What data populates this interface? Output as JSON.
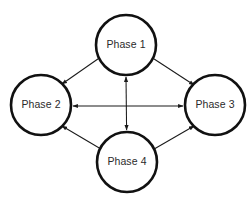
{
  "diagram": {
    "type": "cycle-network",
    "background_color": "#ffffff",
    "node_fill": "#ffffff",
    "node_stroke": "#111111",
    "edge_color": "#1a1a1a",
    "label_color": "#2b2b2b",
    "node_radius": 30,
    "nodes": [
      {
        "id": "phase1",
        "label": "Phase 1",
        "x": 126,
        "y": 45
      },
      {
        "id": "phase2",
        "label": "Phase 2",
        "x": 41,
        "y": 105
      },
      {
        "id": "phase3",
        "label": "Phase 3",
        "x": 215,
        "y": 105
      },
      {
        "id": "phase4",
        "label": "Phase 4",
        "x": 127,
        "y": 162
      }
    ],
    "edges": [
      {
        "id": "edge-phase2-phase1",
        "from": "phase2",
        "to": "phase1",
        "arrows": "both",
        "orientation": "diagonal"
      },
      {
        "id": "edge-phase1-phase3",
        "from": "phase1",
        "to": "phase3",
        "arrows": "both",
        "orientation": "diagonal"
      },
      {
        "id": "edge-phase2-phase4",
        "from": "phase2",
        "to": "phase4",
        "arrows": "both",
        "orientation": "diagonal"
      },
      {
        "id": "edge-phase4-phase3",
        "from": "phase4",
        "to": "phase3",
        "arrows": "both",
        "orientation": "diagonal"
      },
      {
        "id": "edge-phase2-phase3",
        "from": "phase2",
        "to": "phase3",
        "arrows": "both",
        "orientation": "horizontal"
      },
      {
        "id": "edge-phase1-phase4",
        "from": "phase1",
        "to": "phase4",
        "arrows": "both",
        "orientation": "vertical"
      }
    ]
  }
}
